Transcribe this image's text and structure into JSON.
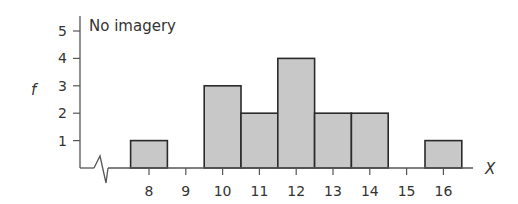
{
  "chart_data": {
    "type": "bar",
    "title": "No imagery",
    "xlabel": "X",
    "ylabel": "f",
    "categories": [
      "8",
      "9",
      "10",
      "11",
      "12",
      "13",
      "14",
      "15",
      "16"
    ],
    "values": [
      1,
      0,
      3,
      2,
      4,
      2,
      2,
      0,
      1
    ],
    "yticks": [
      1,
      2,
      3,
      4,
      5
    ],
    "ylim": [
      0,
      5
    ],
    "xlim": [
      8,
      16
    ],
    "grid": false,
    "axis_break": true,
    "bar_fill": "#c8c8c8",
    "bar_stroke": "#2a2a2a"
  }
}
